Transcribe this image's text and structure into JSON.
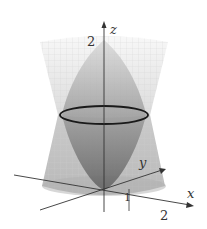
{
  "diagram": {
    "title": "",
    "axes": {
      "x_label": "x",
      "y_label": "y",
      "z_label": "z"
    },
    "ticks": {
      "z_tick": "2",
      "x_tick_1": "1",
      "x_tick_2": "2"
    },
    "colors": {
      "cone_grid": "#c8c8c8",
      "cone_fill": "#9a9a9a",
      "paraboloid_fill": "#6e6e6e",
      "circle": "#1a1a1a",
      "axis": "#333333"
    }
  }
}
